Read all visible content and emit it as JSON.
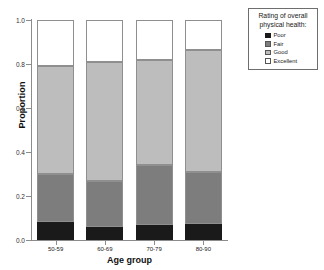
{
  "chart_data": {
    "type": "bar",
    "stacked": true,
    "normalized": true,
    "title": "",
    "xlabel": "Age group",
    "ylabel": "Proportion",
    "categories": [
      "50-59",
      "60-69",
      "70-79",
      "80-90"
    ],
    "series": [
      {
        "name": "Poor",
        "color": "#1a1a1a",
        "values": [
          0.08,
          0.06,
          0.07,
          0.075
        ]
      },
      {
        "name": "Fair",
        "color": "#7d7d7d",
        "values": [
          0.22,
          0.21,
          0.27,
          0.235
        ]
      },
      {
        "name": "Good",
        "color": "#bdbdbd",
        "values": [
          0.49,
          0.54,
          0.48,
          0.555
        ]
      },
      {
        "name": "Excellent",
        "color": "#ffffff",
        "values": [
          0.21,
          0.19,
          0.18,
          0.135
        ]
      }
    ],
    "cumulative_tops": [
      {
        "category": "50-59",
        "poor": 0.08,
        "fair": 0.3,
        "good": 0.79,
        "excellent": 1.0
      },
      {
        "category": "60-69",
        "poor": 0.06,
        "fair": 0.27,
        "good": 0.81,
        "excellent": 1.0
      },
      {
        "category": "70-79",
        "poor": 0.07,
        "fair": 0.34,
        "good": 0.82,
        "excellent": 1.0
      },
      {
        "category": "80-90",
        "poor": 0.075,
        "fair": 0.31,
        "good": 0.865,
        "excellent": 1.0
      }
    ],
    "ylim": [
      0.0,
      1.0
    ],
    "yticks": [
      "0.0",
      "0.2",
      "0.4",
      "0.6",
      "0.8",
      "1.0"
    ],
    "ytick_values": [
      0.0,
      0.2,
      0.4,
      0.6,
      0.8,
      1.0
    ],
    "grid": false,
    "legend_position": "top-right"
  },
  "legend": {
    "title_line1": "Rating of overall",
    "title_line2": "physical health:",
    "items": [
      {
        "label": "Poor",
        "key": "poor"
      },
      {
        "label": "Fair",
        "key": "fair"
      },
      {
        "label": "Good",
        "key": "good"
      },
      {
        "label": "Excellent",
        "key": "excellent"
      }
    ]
  },
  "colors": {
    "poor": "#1a1a1a",
    "fair": "#7d7d7d",
    "good": "#bdbdbd",
    "excellent": "#ffffff",
    "axis": "#8c8c8c",
    "text": "#1a1a1a"
  }
}
